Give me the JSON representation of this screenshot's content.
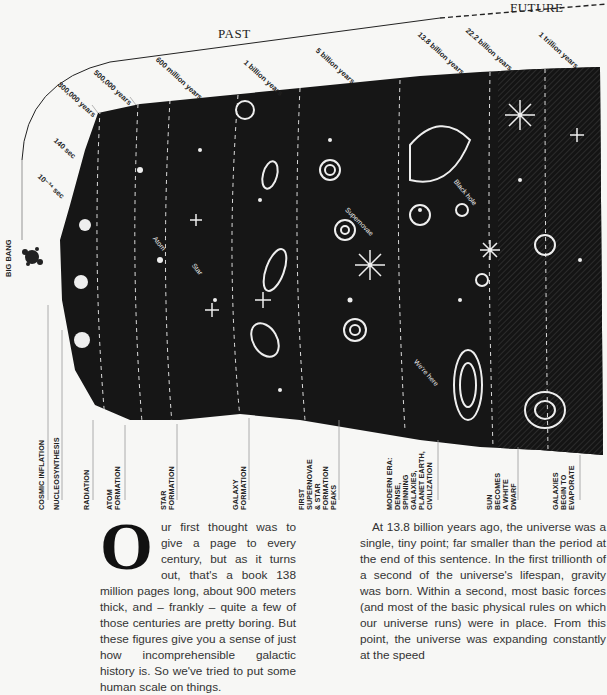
{
  "diagram": {
    "origin_label": "BIG BANG",
    "sections": {
      "past": "PAST",
      "future": "FUTURE"
    },
    "time_ticks": [
      {
        "label": "10⁻³⁴ sec"
      },
      {
        "label": "140 sec"
      },
      {
        "label": "300,000 years"
      },
      {
        "label": "500,000 years"
      },
      {
        "label": "600 million years"
      },
      {
        "label": "1 billion years"
      },
      {
        "label": "5 billion years"
      },
      {
        "label": "13.8 billion years"
      },
      {
        "label": "22.2 billion years"
      },
      {
        "label": "1 trillion years"
      }
    ],
    "eras": [
      {
        "label": "COSMIC INFLATION"
      },
      {
        "label": "NUCLEOSYNTHESIS"
      },
      {
        "label": "RADIATION"
      },
      {
        "label": "ATOM\nFORMATION"
      },
      {
        "label": "STAR\nFORMATION"
      },
      {
        "label": "GALAXY\nFORMATION"
      },
      {
        "label": "FIRST\nSUPERNOVAE\n& STAR\nFORMATION\nPEAKS"
      },
      {
        "label": "MODERN ERA:\nDENSE,\nSPINNING\nGALAXIES,\nPLANET EARTH,\nCIVILIZATION"
      },
      {
        "label": "SUN\nBECOMES\nA WHITE\nDWARF"
      },
      {
        "label": "GALAXIES\nBEGIN TO\nEVAPORATE"
      }
    ],
    "annotations": {
      "atom": "Atom",
      "star": "Star",
      "supernovae": "Supernovae",
      "black_hole": "Black hole",
      "we_are_here": "We're here"
    }
  },
  "article": {
    "dropcap": "O",
    "col1": "ur first thought was to give a page to every century, but as it turns out, that's a book 138 million pages long, about 900 meters thick, and – frankly – quite a few of those centuries are pretty boring. But these figures give you a sense of just how incomprehensible galactic history is. So we've tried to put some human scale on things.",
    "col2": "At 13.8 billion years ago, the universe was a single, tiny point; far smaller than the period at the end of this sentence. In the first trillionth of a second of the universe's lifespan, gravity was born. Within a second, most basic forces (and most of the basic physical rules on which our universe runs) were in place. From this point, the universe was expanding constantly at the speed"
  }
}
